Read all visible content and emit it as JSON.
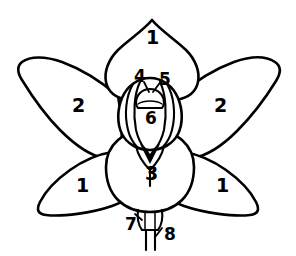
{
  "figure": {
    "style": "black-and-white line drawing",
    "background_color": "#ffffff",
    "line_color": "#000000",
    "width_px": 296,
    "height_px": 256
  },
  "labels": [
    {
      "id": "sepal-dorsal",
      "text": "1",
      "x": 146,
      "y": 28,
      "size": "lg"
    },
    {
      "id": "petal-left",
      "text": "2",
      "x": 72,
      "y": 96,
      "size": "lg"
    },
    {
      "id": "petal-right",
      "text": "2",
      "x": 214,
      "y": 96,
      "size": "lg"
    },
    {
      "id": "anther",
      "text": "4",
      "x": 134,
      "y": 68,
      "size": "md"
    },
    {
      "id": "stigma",
      "text": "5",
      "x": 159,
      "y": 71,
      "size": "md"
    },
    {
      "id": "column",
      "text": "6",
      "x": 145,
      "y": 110,
      "size": "md"
    },
    {
      "id": "labellum",
      "text": "3",
      "x": 145,
      "y": 164,
      "size": "lg"
    },
    {
      "id": "sepal-lower-left",
      "text": "1",
      "x": 76,
      "y": 176,
      "size": "lg"
    },
    {
      "id": "sepal-lower-right",
      "text": "1",
      "x": 216,
      "y": 176,
      "size": "lg"
    },
    {
      "id": "bract",
      "text": "7",
      "x": 125,
      "y": 216,
      "size": "md"
    },
    {
      "id": "pedicel-ovary",
      "text": "8",
      "x": 164,
      "y": 226,
      "size": "md"
    }
  ],
  "parts": [
    {
      "number": "1",
      "name": "sepal",
      "count": 3
    },
    {
      "number": "2",
      "name": "petal",
      "count": 2
    },
    {
      "number": "3",
      "name": "labellum",
      "count": 1
    },
    {
      "number": "4",
      "name": "anther",
      "count": 1
    },
    {
      "number": "5",
      "name": "stigma",
      "count": 1
    },
    {
      "number": "6",
      "name": "column",
      "count": 1
    },
    {
      "number": "7",
      "name": "bract",
      "count": 1
    },
    {
      "number": "8",
      "name": "pedicel-ovary",
      "count": 1
    }
  ]
}
